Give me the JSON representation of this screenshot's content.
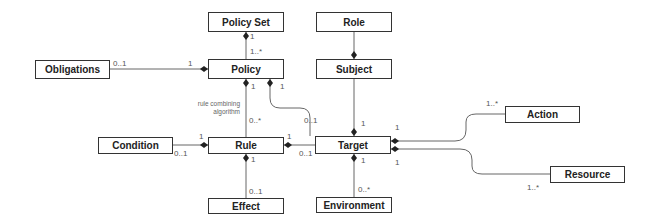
{
  "diagram": {
    "type": "UML class diagram",
    "classes": {
      "policy_set": {
        "label": "Policy Set",
        "x": 208,
        "y": 12,
        "w": 76,
        "h": 20
      },
      "role": {
        "label": "Role",
        "x": 316,
        "y": 12,
        "w": 76,
        "h": 20
      },
      "obligations": {
        "label": "Obligations",
        "x": 35,
        "y": 60,
        "w": 75,
        "h": 19
      },
      "policy": {
        "label": "Policy",
        "x": 208,
        "y": 59,
        "w": 76,
        "h": 20
      },
      "subject": {
        "label": "Subject",
        "x": 316,
        "y": 59,
        "w": 76,
        "h": 20
      },
      "condition": {
        "label": "Condition",
        "x": 98,
        "y": 137,
        "w": 75,
        "h": 17
      },
      "rule": {
        "label": "Rule",
        "x": 208,
        "y": 137,
        "w": 76,
        "h": 17
      },
      "target": {
        "label": "Target",
        "x": 315,
        "y": 136,
        "w": 76,
        "h": 18
      },
      "action": {
        "label": "Action",
        "x": 505,
        "y": 106,
        "w": 75,
        "h": 17
      },
      "resource": {
        "label": "Resource",
        "x": 550,
        "y": 166,
        "w": 75,
        "h": 17
      },
      "effect": {
        "label": "Effect",
        "x": 208,
        "y": 198,
        "w": 76,
        "h": 16
      },
      "environment": {
        "label": "Environment",
        "x": 316,
        "y": 197,
        "w": 76,
        "h": 16
      }
    },
    "note": {
      "line1": "rule combining",
      "line2": "algorithm"
    },
    "multiplicities": {
      "policyset_policy_top": "1",
      "policyset_policy_bottom": "1..*",
      "obligations_side": "0..1",
      "policy_obligations_side": "1",
      "policy_rule_top": "1",
      "policy_rule_bottom": "0..*",
      "policy_target_top": "1",
      "policy_target_bottom": "0..1",
      "condition_side": "0..1",
      "rule_condition_side": "1",
      "rule_target_side": "1",
      "target_rule_side": "0..1",
      "rule_effect_top": "1",
      "effect_side": "0..1",
      "subject_target": "1",
      "target_action_side": "1",
      "action_side": "1..*",
      "target_resource_side": "1",
      "resource_side": "1..*",
      "target_env_top": "1",
      "environment_side": "0..*"
    },
    "colors": {
      "line": "#555555",
      "border": "#333333",
      "text": "#222222"
    }
  }
}
